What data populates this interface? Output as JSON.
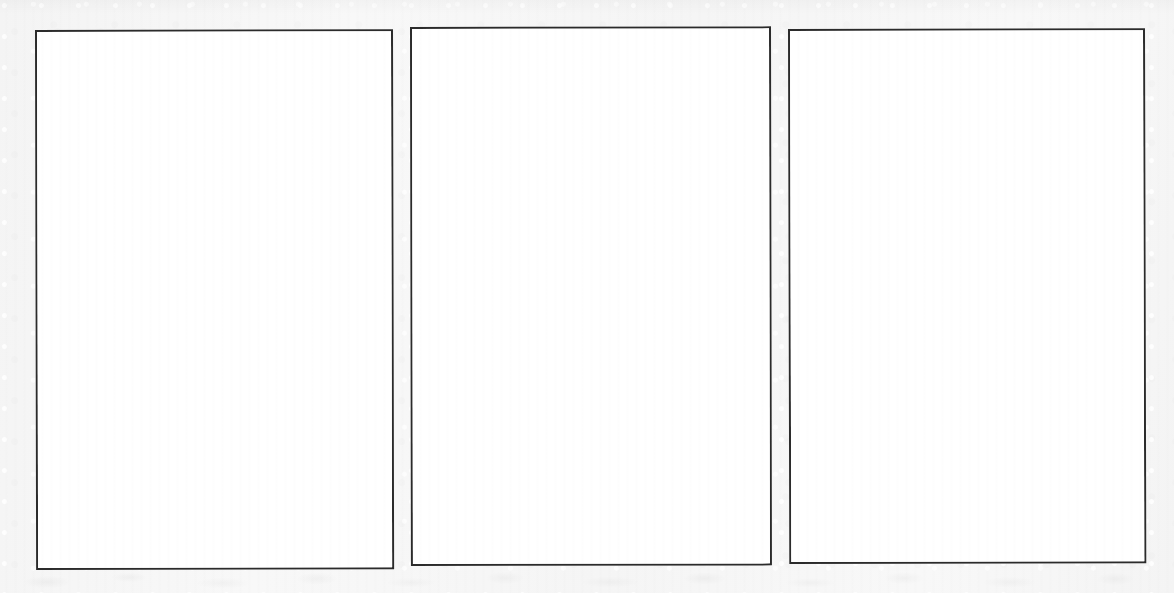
{
  "page": {
    "kind": "scanned-page",
    "background_color": "#f6f6f6",
    "width": 1174,
    "height": 593,
    "caption": ""
  },
  "style": {
    "frame_border_color": "#2b2b2b",
    "frame_fill_color": "#ffffff",
    "frame_border_width_px": 2
  },
  "panels": [
    {
      "id": "panel-left",
      "label": "",
      "content": "",
      "x": 35,
      "y": 30,
      "width": 358,
      "height": 540
    },
    {
      "id": "panel-center",
      "label": "",
      "content": "",
      "x": 410,
      "y": 27,
      "width": 361,
      "height": 539
    },
    {
      "id": "panel-right",
      "label": "",
      "content": "",
      "x": 788,
      "y": 29,
      "width": 357,
      "height": 535
    }
  ],
  "artifacts": {
    "bottom_band": "",
    "top_edge_shade": ""
  }
}
